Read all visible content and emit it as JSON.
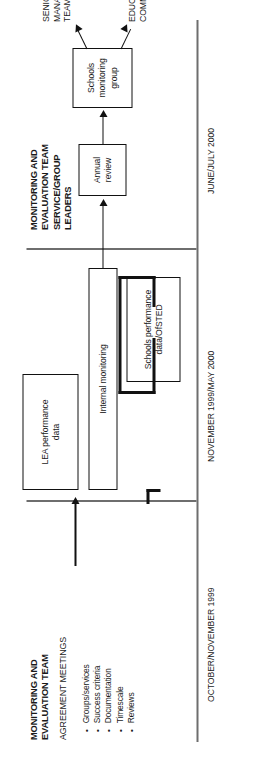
{
  "diagram": {
    "orientation": "rotated-90-ccw",
    "phases": [
      {
        "id": "phase-1",
        "header": "MONITORING AND\nEVALUATION TEAM",
        "sub_header": "AGREEMENT MEETINGS",
        "period": "OCTOBER/NOVEMBER 1999",
        "bullets": [
          "Groups/services",
          "Success criteria",
          "Documentation",
          "Timescale",
          "Reviews"
        ]
      },
      {
        "id": "phase-2",
        "header": "",
        "sub_header": "",
        "period": "NOVEMBER 1999/MAY 2000",
        "bullets": []
      },
      {
        "id": "phase-3",
        "header": "MONITORING AND\nEVALUATION TEAM\nSERVICE/GROUP\nLEADERS",
        "sub_header": "",
        "period": "JUNE/JULY 2000",
        "bullets": []
      }
    ],
    "boxes": [
      {
        "id": "box-lea-performance-data",
        "label": "LEA performance\ndata"
      },
      {
        "id": "box-internal-monitoring",
        "label": "Internal monitoring"
      },
      {
        "id": "box-schools-performance-data",
        "label": "Schools performance\ndata/OfSTED"
      },
      {
        "id": "box-annual-review",
        "label": "Annual\nreview"
      },
      {
        "id": "box-schools-monitoring-group",
        "label": "Schools\nmonitoring\ngroup"
      }
    ],
    "outputs": [
      {
        "id": "output-senior-management-team",
        "label": "SENIOR\nMANAGEMENT\nTEAM"
      },
      {
        "id": "output-education-committee",
        "label": "EDUCATION\nCOMMITTEE"
      }
    ],
    "bullet_marker": "•",
    "colors": {
      "ink": "#111111",
      "axis": "#6e6e6e",
      "background": "#ffffff"
    }
  }
}
